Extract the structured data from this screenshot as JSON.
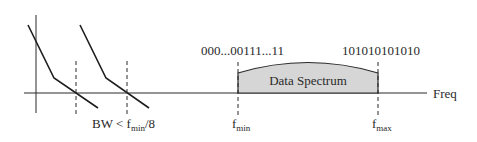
{
  "diagram": {
    "axis_label": "Freq",
    "spectrum_label": "Data Spectrum",
    "left_pattern": "000...00111...11",
    "right_pattern": "101010101010",
    "bw_label_main": "BW < f",
    "bw_label_sub": "min",
    "bw_label_tail": "/8",
    "fmin_main": "f",
    "fmin_sub": "min",
    "fmax_main": "f",
    "fmax_sub": "max",
    "colors": {
      "line": "#2a2a2a",
      "spectrum_fill": "#d6d6d6",
      "background": "#ffffff"
    }
  }
}
